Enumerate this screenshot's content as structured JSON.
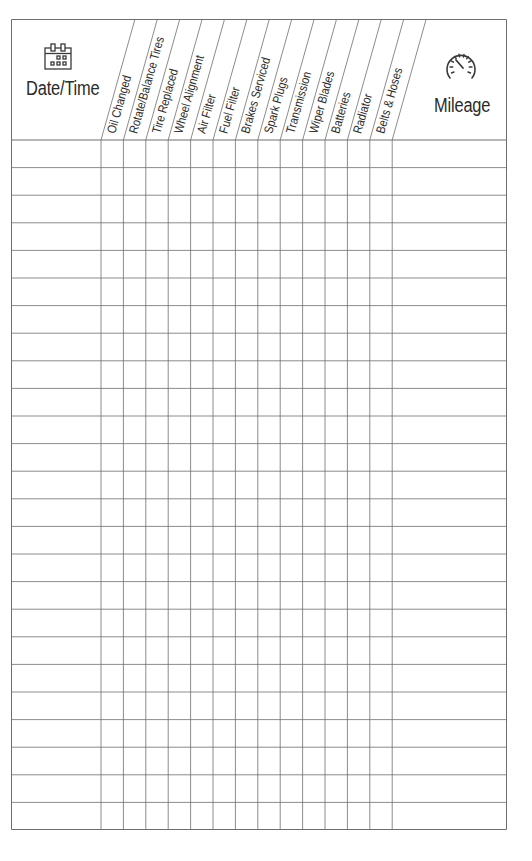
{
  "header": {
    "date_time_label": "Date/Time",
    "date_time_icon": "calendar-icon",
    "mileage_label": "Mileage",
    "mileage_icon": "speedometer-icon"
  },
  "columns": [
    {
      "label": "Oil Changed"
    },
    {
      "label": "Rotate/Balance Tires"
    },
    {
      "label": "Tire Replaced"
    },
    {
      "label": "Wheel Alignment"
    },
    {
      "label": "Air Filter"
    },
    {
      "label": "Fuel Filter"
    },
    {
      "label": "Brakes Serviced"
    },
    {
      "label": "Spark Plugs"
    },
    {
      "label": "Transmission"
    },
    {
      "label": "Wiper Blades"
    },
    {
      "label": "Batteries"
    },
    {
      "label": "Radiator"
    },
    {
      "label": "Belts & Hoses"
    }
  ],
  "rows": {
    "count": 25,
    "values": []
  },
  "colors": {
    "line": "#6e6e6e",
    "text": "#2b2b2b",
    "background": "#ffffff"
  }
}
